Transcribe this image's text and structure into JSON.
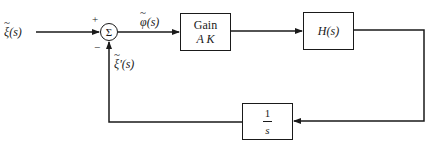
{
  "diagram": {
    "type": "feedback-control-block-diagram",
    "input_signal": {
      "label": "ξ(s)",
      "decoration": "tilde"
    },
    "summing_junction": {
      "symbol": "Σ",
      "plus_sign": "+",
      "minus_sign": "−"
    },
    "error_signal": {
      "label": "φ(s)",
      "decoration": "tilde"
    },
    "feedback_signal": {
      "label": "ξ'(s)",
      "decoration": "tilde"
    },
    "blocks": [
      {
        "id": "gain",
        "line1": "Gain",
        "line2": "A K"
      },
      {
        "id": "plant",
        "label": "H(s)"
      },
      {
        "id": "integrator",
        "numerator": "1",
        "denominator": "s"
      }
    ],
    "connections": [
      "input -> summing_junction(+)",
      "summing_junction -> gain",
      "gain -> plant",
      "plant -> integrator",
      "integrator -> summing_junction(-)"
    ],
    "colors": {
      "line": "#1a1a1a",
      "background": "#ffffff"
    }
  }
}
